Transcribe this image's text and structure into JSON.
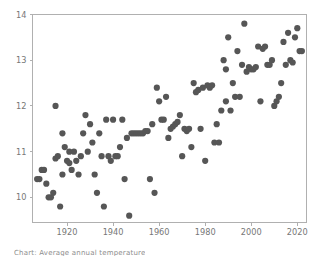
{
  "figure": {
    "caption": "Chart: Average annual temperature"
  },
  "chart_data": {
    "type": "scatter",
    "title": "",
    "xlabel": "",
    "ylabel": "",
    "xlim": [
      1905,
      2024
    ],
    "ylim": [
      9.45,
      14.0
    ],
    "grid": false,
    "legend": null,
    "marker": {
      "color": "#565656",
      "size_px": 3.1,
      "shape": "circle"
    },
    "axes": {
      "x_ticks": [
        1920,
        1940,
        1960,
        1980,
        2000,
        2020
      ],
      "x_tick_labels": [
        "1920",
        "1940",
        "1960",
        "1980",
        "2000",
        "2020"
      ],
      "y_ticks": [
        10,
        11,
        12,
        13,
        14
      ],
      "y_tick_labels": [
        "10",
        "11",
        "12",
        "13",
        "14"
      ],
      "spine_color": "#b0b0b0",
      "tick_label_color": "#777777"
    },
    "series": [
      {
        "name": "annual value",
        "points": [
          [
            1907,
            10.4
          ],
          [
            1908,
            10.4
          ],
          [
            1909,
            10.6
          ],
          [
            1910,
            10.6
          ],
          [
            1911,
            10.3
          ],
          [
            1912,
            10.0
          ],
          [
            1913,
            10.0
          ],
          [
            1914,
            10.1
          ],
          [
            1915,
            12.0
          ],
          [
            1915,
            10.85
          ],
          [
            1916,
            10.9
          ],
          [
            1917,
            9.8
          ],
          [
            1918,
            10.5
          ],
          [
            1918,
            11.4
          ],
          [
            1919,
            11.1
          ],
          [
            1920,
            10.8
          ],
          [
            1921,
            11.0
          ],
          [
            1921,
            10.75
          ],
          [
            1922,
            10.6
          ],
          [
            1923,
            11.0
          ],
          [
            1924,
            10.8
          ],
          [
            1925,
            10.5
          ],
          [
            1926,
            10.9
          ],
          [
            1927,
            11.4
          ],
          [
            1928,
            11.8
          ],
          [
            1929,
            11.0
          ],
          [
            1930,
            11.6
          ],
          [
            1931,
            11.2
          ],
          [
            1932,
            10.5
          ],
          [
            1933,
            10.1
          ],
          [
            1934,
            11.4
          ],
          [
            1935,
            10.9
          ],
          [
            1936,
            9.8
          ],
          [
            1937,
            11.7
          ],
          [
            1938,
            10.9
          ],
          [
            1939,
            10.8
          ],
          [
            1940,
            11.7
          ],
          [
            1941,
            10.9
          ],
          [
            1942,
            10.9
          ],
          [
            1943,
            11.1
          ],
          [
            1944,
            11.7
          ],
          [
            1945,
            10.4
          ],
          [
            1946,
            11.3
          ],
          [
            1947,
            9.6
          ],
          [
            1948,
            11.4
          ],
          [
            1949,
            11.4
          ],
          [
            1950,
            11.4
          ],
          [
            1951,
            11.4
          ],
          [
            1952,
            11.4
          ],
          [
            1953,
            11.4
          ],
          [
            1954,
            11.45
          ],
          [
            1955,
            11.45
          ],
          [
            1956,
            10.4
          ],
          [
            1957,
            11.6
          ],
          [
            1958,
            10.1
          ],
          [
            1959,
            12.4
          ],
          [
            1960,
            12.1
          ],
          [
            1961,
            11.7
          ],
          [
            1962,
            11.7
          ],
          [
            1963,
            12.2
          ],
          [
            1964,
            11.3
          ],
          [
            1965,
            11.5
          ],
          [
            1966,
            11.55
          ],
          [
            1967,
            11.6
          ],
          [
            1968,
            11.65
          ],
          [
            1969,
            11.8
          ],
          [
            1970,
            10.9
          ],
          [
            1971,
            11.5
          ],
          [
            1972,
            11.45
          ],
          [
            1973,
            11.5
          ],
          [
            1974,
            11.1
          ],
          [
            1975,
            12.5
          ],
          [
            1976,
            12.3
          ],
          [
            1977,
            12.35
          ],
          [
            1978,
            11.5
          ],
          [
            1979,
            12.4
          ],
          [
            1980,
            10.8
          ],
          [
            1981,
            12.45
          ],
          [
            1982,
            12.4
          ],
          [
            1983,
            12.45
          ],
          [
            1984,
            11.2
          ],
          [
            1985,
            11.6
          ],
          [
            1986,
            11.2
          ],
          [
            1987,
            11.9
          ],
          [
            1988,
            13.0
          ],
          [
            1989,
            12.1
          ],
          [
            1989,
            12.8
          ],
          [
            1990,
            13.5
          ],
          [
            1991,
            11.9
          ],
          [
            1992,
            12.5
          ],
          [
            1993,
            12.2
          ],
          [
            1994,
            13.2
          ],
          [
            1995,
            12.2
          ],
          [
            1996,
            12.9
          ],
          [
            1997,
            13.8
          ],
          [
            1998,
            12.75
          ],
          [
            1999,
            12.85
          ],
          [
            2000,
            12.8
          ],
          [
            2001,
            12.8
          ],
          [
            2002,
            12.85
          ],
          [
            2003,
            13.3
          ],
          [
            2004,
            12.1
          ],
          [
            2005,
            13.25
          ],
          [
            2006,
            13.3
          ],
          [
            2007,
            12.9
          ],
          [
            2008,
            12.9
          ],
          [
            2009,
            13.0
          ],
          [
            2010,
            12.0
          ],
          [
            2011,
            12.1
          ],
          [
            2012,
            12.2
          ],
          [
            2013,
            12.5
          ],
          [
            2014,
            13.4
          ],
          [
            2015,
            12.9
          ],
          [
            2016,
            13.6
          ],
          [
            2017,
            13.0
          ],
          [
            2018,
            12.95
          ],
          [
            2019,
            13.5
          ],
          [
            2020,
            13.7
          ],
          [
            2021,
            13.2
          ],
          [
            2022,
            13.2
          ]
        ]
      }
    ]
  }
}
